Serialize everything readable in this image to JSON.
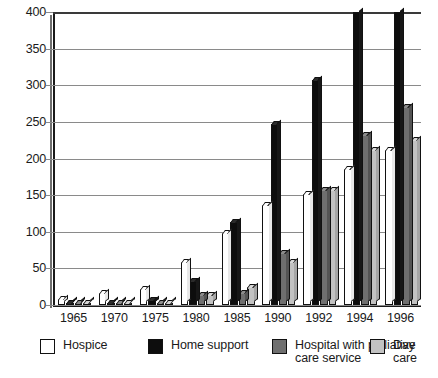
{
  "chart_data": {
    "type": "bar",
    "title": "",
    "subtitle": "",
    "xlabel": "",
    "ylabel": "",
    "categories": [
      "1965",
      "1970",
      "1975",
      "1980",
      "1985",
      "1990",
      "1992",
      "1994",
      "1996"
    ],
    "ylim": [
      0,
      400
    ],
    "yticks": [
      0,
      50,
      100,
      150,
      200,
      250,
      300,
      350,
      400
    ],
    "grid": true,
    "legend_position": "bottom",
    "note": "Home support bars for 1994 and 1996 are clipped by the 400 axis maximum",
    "series": [
      {
        "name": "Hospice",
        "color": "#ffffff",
        "values": [
          8,
          16,
          22,
          59,
          98,
          136,
          152,
          186,
          212
        ]
      },
      {
        "name": "Home support",
        "color": "#0d0d0d",
        "values": [
          3,
          3,
          7,
          33,
          113,
          247,
          307,
          400,
          400
        ]
      },
      {
        "name": "Hospital with palliative care service",
        "color": "#6f6f6f",
        "values": [
          2,
          1,
          1,
          14,
          17,
          71,
          157,
          232,
          270
        ]
      },
      {
        "name": "Day care",
        "color": "#c2c2c2",
        "values": [
          1,
          1,
          1,
          13,
          25,
          59,
          157,
          212,
          225
        ]
      }
    ]
  },
  "axis": {
    "y_ticks": [
      "0",
      "50",
      "100",
      "150",
      "200",
      "250",
      "300",
      "350",
      "400"
    ],
    "x_ticks": [
      "1965",
      "1970",
      "1975",
      "1980",
      "1985",
      "1990",
      "1992",
      "1994",
      "1996"
    ]
  },
  "legend": {
    "items": [
      {
        "label": "Hospice",
        "swatch": "sw-hospice",
        "name": "legend-hospice"
      },
      {
        "label": "Home support",
        "swatch": "sw-home",
        "name": "legend-home-support"
      },
      {
        "label": "Hospital with palliative\ncare service",
        "swatch": "sw-hospital",
        "name": "legend-hospital"
      },
      {
        "label": "Day care",
        "swatch": "sw-day",
        "name": "legend-day-care"
      }
    ]
  }
}
